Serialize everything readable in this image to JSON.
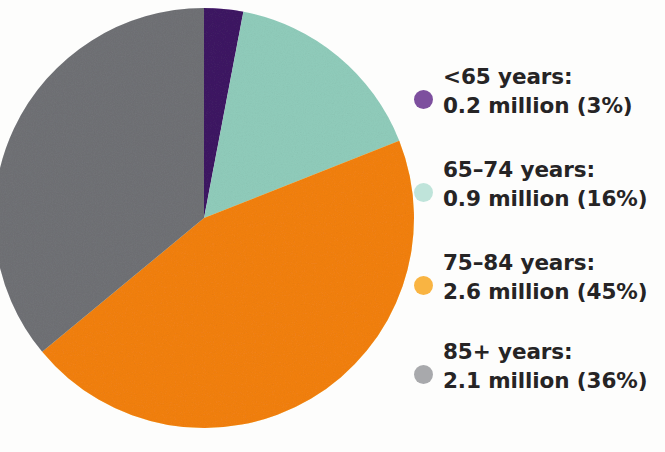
{
  "chart_data": {
    "type": "pie",
    "title": "",
    "subtitle": "",
    "xlabel": "",
    "ylabel": "",
    "legend_position": "right",
    "grid": false,
    "unit": "million",
    "categories": [
      "<65 years",
      "65–74 years",
      "75–84 years",
      "85+ years"
    ],
    "values": [
      0.2,
      0.9,
      2.6,
      2.1
    ],
    "percentages": [
      3,
      16,
      45,
      36
    ],
    "colors": [
      "#7d4f9e",
      "#bfe4da",
      "#f9b442",
      "#a8a9ac"
    ],
    "start_angle_deg": 0,
    "direction": "clockwise",
    "slices": [
      {
        "label": "<65 years",
        "value": 0.2,
        "percent": 3,
        "color": "#7d4f9e"
      },
      {
        "label": "65–74 years",
        "value": 0.9,
        "percent": 16,
        "color": "#bfe4da"
      },
      {
        "label": "75–84 years",
        "value": 2.6,
        "percent": 45,
        "color": "#f9b442"
      },
      {
        "label": "85+ years",
        "value": 2.1,
        "percent": 36,
        "color": "#a8a9ac"
      }
    ]
  },
  "legend": {
    "items": [
      {
        "color": "#7d4f9e",
        "line1": "<65 years:",
        "line2": "0.2 million (3%)"
      },
      {
        "color": "#bfe4da",
        "line1": "65–74 years:",
        "line2": "0.9 million (16%)"
      },
      {
        "color": "#f9b442",
        "line1": "75–84 years:",
        "line2": "2.6 million (45%)"
      },
      {
        "color": "#a8a9ac",
        "line1": "85+ years:",
        "line2": "2.1 million (36%)"
      }
    ]
  },
  "theme": {
    "background": "#fdfdfc",
    "text_color": "#262425"
  }
}
